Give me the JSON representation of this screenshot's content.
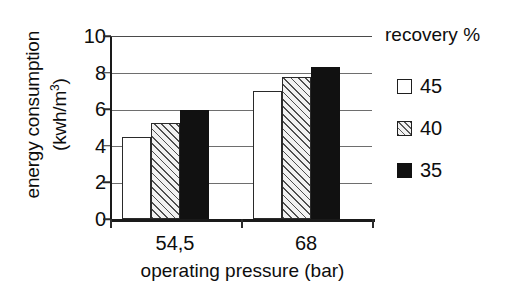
{
  "chart_data": {
    "type": "bar",
    "title": "",
    "xlabel": "operating pressure (bar)",
    "ylabel": "energy consumption (kwh/m3)",
    "ylabel_line1": "energy consumption",
    "ylabel_line2_prefix": "(kwh/m",
    "ylabel_line2_sup": "3",
    "ylabel_line2_suffix": ")",
    "categories": [
      "54,5",
      "68"
    ],
    "yticks": [
      "0",
      "2",
      "4",
      "6",
      "8",
      "10"
    ],
    "ylim": [
      0,
      10
    ],
    "grid": true,
    "legend_position": "right",
    "legend_title": "recovery %",
    "series": [
      {
        "name": "45",
        "values": [
          4.5,
          7.05
        ],
        "fill": "white",
        "color": "#ffffff"
      },
      {
        "name": "40",
        "values": [
          5.3,
          7.8
        ],
        "fill": "hatched",
        "color": "#f2f2f2"
      },
      {
        "name": "35",
        "values": [
          6.0,
          8.35
        ],
        "fill": "solid-black",
        "color": "#111111"
      }
    ]
  },
  "axis": {
    "y_title_line1": "energy consumption",
    "x_title": "operating pressure (bar)",
    "tick_10": "10",
    "tick_8": "8",
    "tick_6": "6",
    "tick_4": "4",
    "tick_2": "2",
    "tick_0": "0",
    "cat_1": "54,5",
    "cat_2": "68"
  },
  "legend": {
    "title": "recovery %",
    "items": [
      {
        "label": "45"
      },
      {
        "label": "40"
      },
      {
        "label": "35"
      }
    ]
  }
}
